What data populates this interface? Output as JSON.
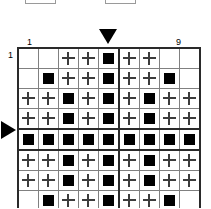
{
  "top_widgets": [
    {
      "name": "top-widget-left",
      "label": ""
    },
    {
      "name": "top-widget-right",
      "label": ""
    }
  ],
  "labels": {
    "column_first": "1",
    "column_last": "9",
    "row_first": "1",
    "row_right": "1"
  },
  "markers": {
    "column_pointer_icon": "triangle-down-icon",
    "column_pointer_target": "5",
    "row_pointer_icon": "triangle-right-icon",
    "row_pointer_target": "5"
  },
  "colors": {
    "fill": "#000000",
    "plus": "#3c3c3c",
    "grid_line": "#808080",
    "grid_border": "#2a2a2a",
    "background": "#ffffff"
  },
  "grid": {
    "rows": 9,
    "columns": 9,
    "legend": {
      "block": "filled-square",
      "plus": "plus-mark",
      "empty": "empty-cell"
    },
    "thick_column_separator_after": 5,
    "thick_row_separator_around": 5,
    "cells": [
      [
        "empty",
        "empty",
        "plus",
        "plus",
        "block",
        "plus",
        "plus",
        "empty",
        "empty"
      ],
      [
        "empty",
        "block",
        "plus",
        "plus",
        "block",
        "plus",
        "plus",
        "block",
        "empty"
      ],
      [
        "plus",
        "plus",
        "block",
        "plus",
        "block",
        "plus",
        "block",
        "plus",
        "plus"
      ],
      [
        "plus",
        "plus",
        "block",
        "plus",
        "block",
        "plus",
        "block",
        "plus",
        "plus"
      ],
      [
        "block",
        "block",
        "block",
        "block",
        "block",
        "block",
        "block",
        "block",
        "block"
      ],
      [
        "plus",
        "plus",
        "block",
        "plus",
        "block",
        "plus",
        "block",
        "plus",
        "plus"
      ],
      [
        "plus",
        "plus",
        "block",
        "plus",
        "block",
        "plus",
        "block",
        "plus",
        "plus"
      ],
      [
        "empty",
        "block",
        "plus",
        "plus",
        "block",
        "plus",
        "plus",
        "block",
        "empty"
      ],
      [
        "empty",
        "empty",
        "plus",
        "plus",
        "block",
        "plus",
        "plus",
        "empty",
        "empty"
      ]
    ]
  }
}
